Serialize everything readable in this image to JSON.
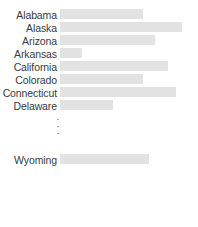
{
  "chart_data": {
    "type": "bar",
    "orientation": "horizontal",
    "title": "",
    "subtitle": "",
    "xlabel": "",
    "ylabel": "",
    "grid": false,
    "legend": null,
    "axis_visible": false,
    "tick_labels_x": [],
    "bar_color": "#e2e2e2",
    "label_color": "#3a3a3a",
    "background_color": "#ffffff",
    "categories": [
      "Alabama",
      "Alaska",
      "Arizona",
      "Arkansas",
      "California",
      "Colorado",
      "Connecticut",
      "Delaware",
      "Wyoming"
    ],
    "values": [
      62,
      101,
      73,
      17,
      85,
      62,
      95,
      41,
      70
    ],
    "xlim": [
      0,
      138
    ],
    "truncated": true,
    "truncation_marker": "vertical-ellipsis",
    "truncation_dots": [
      "·",
      "·",
      "·"
    ],
    "note": "Rows between Delaware and Wyoming are elided by a vertical ellipsis."
  },
  "rows": [
    {
      "label": "Alabama",
      "value": 62,
      "width_px": 83
    },
    {
      "label": "Alaska",
      "value": 101,
      "width_px": 122
    },
    {
      "label": "Arizona",
      "value": 73,
      "width_px": 95
    },
    {
      "label": "Arkansas",
      "value": 17,
      "width_px": 22
    },
    {
      "label": "California",
      "value": 85,
      "width_px": 108
    },
    {
      "label": "Colorado",
      "value": 62,
      "width_px": 83
    },
    {
      "label": "Connecticut",
      "value": 95,
      "width_px": 116
    },
    {
      "label": "Delaware",
      "value": 41,
      "width_px": 53
    },
    {
      "label": "Wyoming",
      "value": 70,
      "width_px": 89
    }
  ],
  "ellipsis": {
    "dot1": "·",
    "dot2": "·",
    "dot3": "·"
  }
}
